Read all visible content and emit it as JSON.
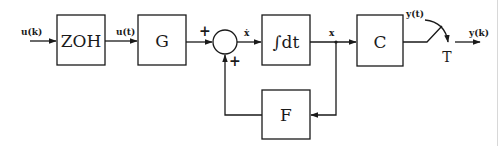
{
  "diagram": {
    "type": "block-diagram",
    "colors": {
      "stroke": "#1a1a1a",
      "background": "#ffffff"
    },
    "blocks": [
      {
        "id": "zoh",
        "label": "ZOH"
      },
      {
        "id": "g",
        "label": "G"
      },
      {
        "id": "integrator",
        "label": "∫dt"
      },
      {
        "id": "c",
        "label": "C"
      },
      {
        "id": "f",
        "label": "F"
      }
    ],
    "summing_junction": {
      "signs": [
        "+",
        "+"
      ]
    },
    "signals": {
      "input": "u(k)",
      "zoh_out": "u(t)",
      "state_derivative": "ẋ",
      "state": "x",
      "continuous_output": "y(t)",
      "output": "y(k)"
    },
    "sampler": {
      "label": "T"
    }
  }
}
